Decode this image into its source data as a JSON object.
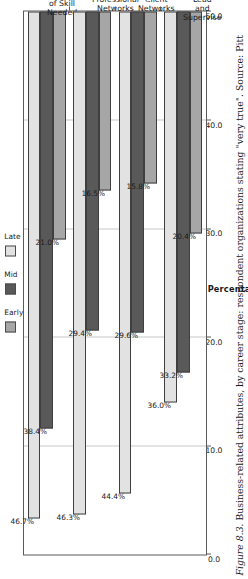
{
  "caption": {
    "figure_number": "Figure 8.3.",
    "text": " Business-related attributes, by career stage: respondent organizations stating \"very true\". Source: Pitt"
  },
  "legend": {
    "position": "top",
    "entries": [
      {
        "label": "Early",
        "color": "#a6a6a6"
      },
      {
        "label": "Mid",
        "color": "#595959"
      },
      {
        "label": "Late",
        "color": "#e2e2e2"
      }
    ]
  },
  "axis": {
    "title": "Percentage",
    "ticks": [
      "50.0",
      "40.0",
      "30.0",
      "20.0",
      "10.0",
      "0.0"
    ]
  },
  "chart_data": {
    "type": "bar",
    "title": "",
    "orientation": "vertical",
    "categories": [
      "Level of Skill\nNeeded",
      "Professional\nNetworks",
      "Client Networks",
      "Want to Lead\nand Supervise"
    ],
    "series": [
      {
        "name": "Early",
        "color": "#a6a6a6",
        "values": [
          21.0,
          16.5,
          15.8,
          20.4
        ],
        "labels": [
          "21.0%",
          "16.5%",
          "15.8%",
          "20.4%"
        ]
      },
      {
        "name": "Mid",
        "color": "#595959",
        "values": [
          38.4,
          29.4,
          29.6,
          33.2
        ],
        "labels": [
          "38.4%",
          "29.4%",
          "29.6%",
          "33.2%"
        ]
      },
      {
        "name": "Late",
        "color": "#e2e2e2",
        "values": [
          46.7,
          46.3,
          44.4,
          36.0
        ],
        "labels": [
          "46.7%",
          "46.3%",
          "44.4%",
          "36.0%"
        ]
      }
    ],
    "xlabel": "",
    "ylabel": "Percentage",
    "ylim": [
      0.0,
      50.0
    ],
    "ytick_values": [
      0.0,
      10.0,
      20.0,
      30.0,
      40.0,
      50.0
    ],
    "grid": true,
    "legend_position": "top"
  }
}
